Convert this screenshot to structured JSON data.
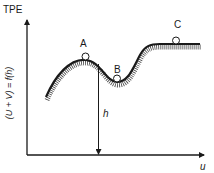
{
  "diagram": {
    "type": "potential-energy-landscape",
    "y_axis": {
      "title": "TPE",
      "rotated_label": "(U + V) = f(h)"
    },
    "x_axis": {
      "label": "u"
    },
    "height_marker": {
      "label": "h"
    },
    "points": [
      {
        "id": "A",
        "label": "A",
        "description": "ball on hilltop (unstable equilibrium)"
      },
      {
        "id": "B",
        "label": "B",
        "description": "ball in valley (stable equilibrium)"
      },
      {
        "id": "C",
        "label": "C",
        "description": "ball on plateau (neutral equilibrium)"
      }
    ],
    "colors": {
      "line": "#1a1a1a",
      "hatch": "#333333",
      "background": "#ffffff"
    }
  }
}
